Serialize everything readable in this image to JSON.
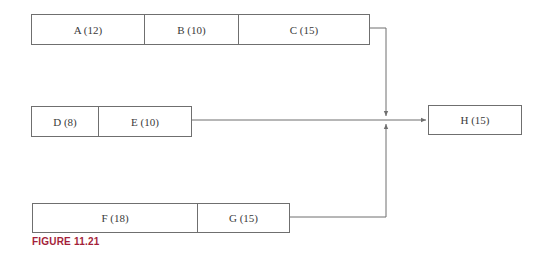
{
  "diagram": {
    "rows": [
      {
        "id": "row-1",
        "activities": [
          {
            "label": "A (12)"
          },
          {
            "label": "B (10)"
          },
          {
            "label": "C (15)"
          }
        ]
      },
      {
        "id": "row-2",
        "activities": [
          {
            "label": "D (8)"
          },
          {
            "label": "E (10)"
          }
        ]
      },
      {
        "id": "row-3",
        "activities": [
          {
            "label": "F (18)"
          },
          {
            "label": "G (15)"
          }
        ]
      }
    ],
    "merge_activity": {
      "label": "H (15)"
    },
    "caption": "FIGURE 11.21",
    "colors": {
      "line": "#6f6f6f",
      "caption": "#a41f3a",
      "text": "#3a3a3a"
    }
  }
}
